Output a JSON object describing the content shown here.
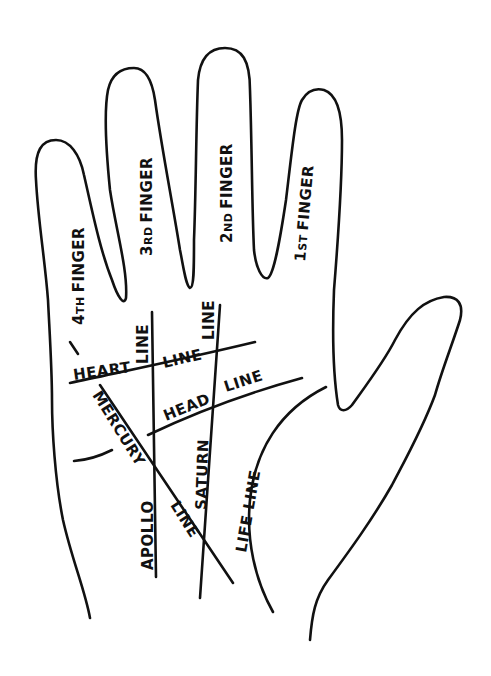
{
  "diagram": {
    "colors": {
      "background": "#ffffff",
      "ink": "#111111"
    },
    "fingers": [
      {
        "id": "fourth",
        "prefix": "4",
        "suffix": "TH",
        "word": "FINGER"
      },
      {
        "id": "third",
        "prefix": "3",
        "suffix": "RD",
        "word": "FINGER"
      },
      {
        "id": "second",
        "prefix": "2",
        "suffix": "ND",
        "word": "FINGER"
      },
      {
        "id": "first",
        "prefix": "1",
        "suffix": "ST",
        "word": "FINGER"
      }
    ],
    "lines": {
      "heart": {
        "word1": "HEART",
        "word2": "LINE"
      },
      "head": {
        "word1": "HEAD",
        "word2": "LINE"
      },
      "apollo": {
        "word1": "APOLLO",
        "word2": "LINE"
      },
      "saturn": {
        "word1": "SATURN",
        "word2": "LINE"
      },
      "mercury": {
        "word1": "MERCURY",
        "word2": "LINE"
      },
      "life": {
        "label": "LIFE LINE"
      }
    }
  }
}
